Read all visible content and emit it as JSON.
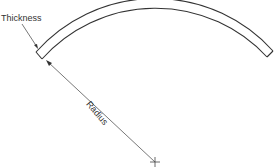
{
  "diagram": {
    "labels": {
      "thickness": "Thickness",
      "radius": "Radius"
    },
    "colors": {
      "line": "#333333",
      "leader": "#555555",
      "background": "#ffffff"
    }
  }
}
